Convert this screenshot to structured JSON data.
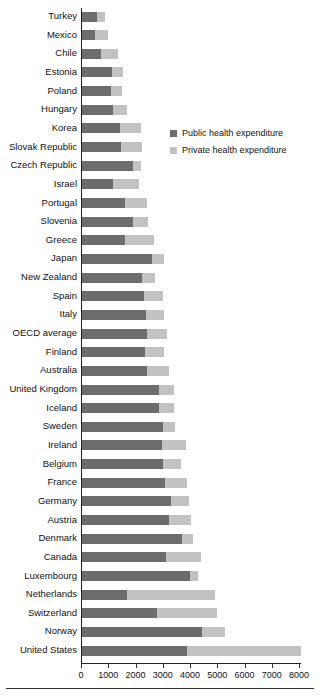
{
  "chart_data": {
    "type": "bar",
    "orientation": "horizontal",
    "stacked": true,
    "title": "",
    "xlabel": "",
    "ylabel": "",
    "xlim": [
      0,
      8000
    ],
    "grid": false,
    "legend_position": "upper-right-inside",
    "xticks": [
      0,
      1000,
      2000,
      3000,
      4000,
      5000,
      6000,
      7000,
      8000
    ],
    "xtick_labels": [
      "0",
      "1000",
      "2000",
      "3000",
      "4000",
      "5000",
      "6000",
      "7000",
      "8000"
    ],
    "categories": [
      "Turkey",
      "Mexico",
      "Chile",
      "Estonia",
      "Poland",
      "Hungary",
      "Korea",
      "Slovak Republic",
      "Czech Republic",
      "Israel",
      "Portugal",
      "Slovenia",
      "Greece",
      "Japan",
      "New Zealand",
      "Spain",
      "Italy",
      "OECD average",
      "Finland",
      "Australia",
      "United Kingdom",
      "Iceland",
      "Sweden",
      "Ireland",
      "Belgium",
      "France",
      "Germany",
      "Austria",
      "Denmark",
      "Canada",
      "Luxembourg",
      "Netherlands",
      "Switzerland",
      "Norway",
      "United States"
    ],
    "series": [
      {
        "name": "Public health expenditure",
        "color": "#6d6d6d",
        "values": [
          550,
          490,
          690,
          1090,
          1080,
          1140,
          1390,
          1420,
          1880,
          1150,
          1560,
          1870,
          1560,
          2580,
          2200,
          2260,
          2360,
          2370,
          2330,
          2380,
          2820,
          2820,
          2960,
          2930,
          2970,
          3040,
          3250,
          3200,
          3680,
          3080,
          3980,
          1660,
          2760,
          4400,
          3870
        ]
      },
      {
        "name": "Private health expenditure",
        "color": "#c2c2c2",
        "values": [
          290,
          480,
          640,
          400,
          400,
          500,
          760,
          770,
          280,
          940,
          810,
          540,
          1100,
          420,
          480,
          710,
          660,
          750,
          670,
          810,
          560,
          540,
          450,
          880,
          660,
          800,
          680,
          800,
          380,
          1290,
          280,
          3210,
          2210,
          840,
          4160
        ]
      }
    ]
  },
  "legend": {
    "items": [
      {
        "label": "Public health expenditure",
        "swatch": "public"
      },
      {
        "label": "Private health expenditure",
        "swatch": "private"
      }
    ]
  }
}
